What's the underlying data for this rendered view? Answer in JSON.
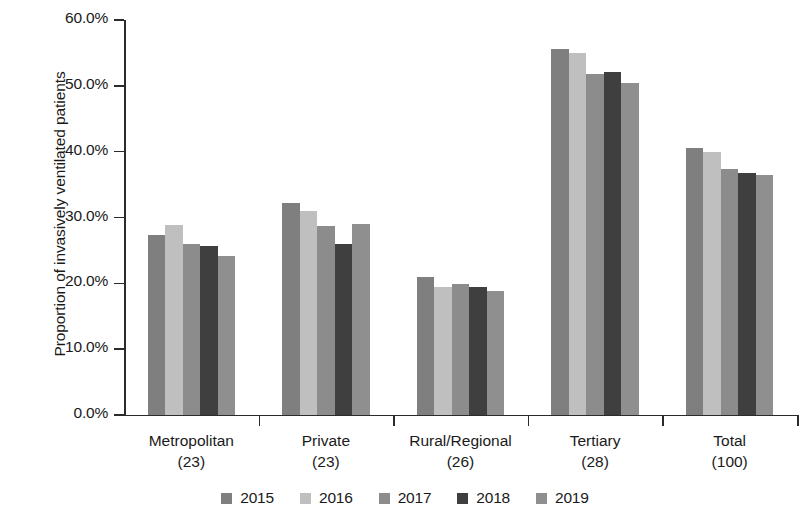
{
  "chart_data": {
    "type": "bar",
    "title": "",
    "subtitle": "",
    "xlabel": "",
    "ylabel": "Proportion of invasively ventilated patients",
    "ylim": [
      0,
      60
    ],
    "ytick_labels": [
      "0.0%",
      "10.0%",
      "20.0%",
      "30.0%",
      "40.0%",
      "50.0%",
      "60.0%"
    ],
    "ytick_values": [
      0,
      10,
      20,
      30,
      40,
      50,
      60
    ],
    "grid": false,
    "legend_position": "bottom",
    "value_suffix": "%",
    "categories": [
      {
        "name": "Metropolitan",
        "count": "(23)"
      },
      {
        "name": "Private",
        "count": "(23)"
      },
      {
        "name": "Rural/Regional",
        "count": "(26)"
      },
      {
        "name": "Tertiary",
        "count": "(28)"
      },
      {
        "name": "Total",
        "count": "(100)"
      }
    ],
    "category_labels": [
      "Metropolitan",
      "Private",
      "Rural/Regional",
      "Tertiary",
      "Total"
    ],
    "series": [
      {
        "name": "2015",
        "color": "#7f7f7f",
        "values": [
          27.4,
          32.2,
          21.0,
          55.6,
          40.6
        ]
      },
      {
        "name": "2016",
        "color": "#bfbfbf",
        "values": [
          28.9,
          31.0,
          19.4,
          55.0,
          40.0
        ]
      },
      {
        "name": "2017",
        "color": "#8c8c8c",
        "values": [
          26.0,
          28.7,
          19.9,
          51.8,
          37.3
        ]
      },
      {
        "name": "2018",
        "color": "#3f3f3f",
        "values": [
          25.6,
          26.0,
          19.5,
          52.1,
          36.8
        ]
      },
      {
        "name": "2019",
        "color": "#8f8f8f",
        "values": [
          24.2,
          29.0,
          18.9,
          50.4,
          36.4
        ]
      }
    ]
  },
  "legend": {
    "items": [
      {
        "label": "2015",
        "color": "#7f7f7f"
      },
      {
        "label": "2016",
        "color": "#bfbfbf"
      },
      {
        "label": "2017",
        "color": "#8c8c8c"
      },
      {
        "label": "2018",
        "color": "#3f3f3f"
      },
      {
        "label": "2019",
        "color": "#8f8f8f"
      }
    ]
  },
  "axis": {
    "y_title": "Proportion of invasively ventilated patients"
  }
}
